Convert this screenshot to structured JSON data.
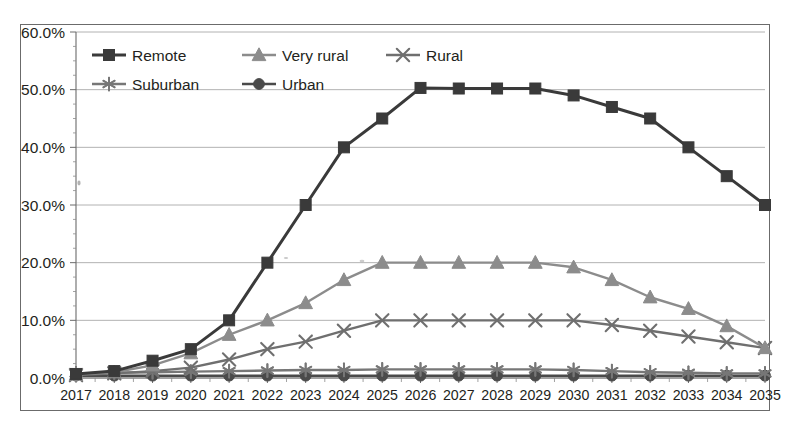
{
  "chart_data": {
    "type": "line",
    "title": "",
    "xlabel": "",
    "ylabel": "",
    "x": [
      2017,
      2018,
      2019,
      2020,
      2021,
      2022,
      2023,
      2024,
      2025,
      2026,
      2027,
      2028,
      2029,
      2030,
      2031,
      2032,
      2033,
      2034,
      2035
    ],
    "categories": [
      "2017",
      "2018",
      "2019",
      "2020",
      "2021",
      "2022",
      "2023",
      "2024",
      "2025",
      "2026",
      "2027",
      "2028",
      "2029",
      "2030",
      "2031",
      "2032",
      "2033",
      "2034",
      "2035"
    ],
    "ylim": [
      0,
      60
    ],
    "ytick_values": [
      0,
      10,
      20,
      30,
      40,
      50,
      60
    ],
    "ytick_labels": [
      "0.0%",
      "10.0%",
      "20.0%",
      "30.0%",
      "40.0%",
      "50.0%",
      "60.0%"
    ],
    "grid": true,
    "legend_position": "top-left-inside",
    "series": [
      {
        "name": "Remote",
        "marker": "square",
        "color": "#3a3a3a",
        "values": [
          0.7,
          1.2,
          3.0,
          5.0,
          10.0,
          20.0,
          30.0,
          40.0,
          45.0,
          50.3,
          50.2,
          50.2,
          50.2,
          49.0,
          47.0,
          45.0,
          40.0,
          35.0,
          30.0
        ]
      },
      {
        "name": "Very rural",
        "marker": "triangle",
        "color": "#8c8c8c",
        "values": [
          0.6,
          1.0,
          2.2,
          4.3,
          7.5,
          10.0,
          13.0,
          17.0,
          20.0,
          20.0,
          20.0,
          20.0,
          20.0,
          19.2,
          17.0,
          14.0,
          12.0,
          9.0,
          5.2
        ]
      },
      {
        "name": "Rural",
        "marker": "x",
        "color": "#6f6f6f",
        "values": [
          0.5,
          0.8,
          1.2,
          1.8,
          3.2,
          5.0,
          6.3,
          8.2,
          10.0,
          10.0,
          10.0,
          10.0,
          10.0,
          10.0,
          9.2,
          8.2,
          7.2,
          6.2,
          5.2
        ]
      },
      {
        "name": "Suburban",
        "marker": "star",
        "color": "#777777",
        "values": [
          0.8,
          0.9,
          1.0,
          1.1,
          1.2,
          1.3,
          1.4,
          1.4,
          1.5,
          1.5,
          1.5,
          1.5,
          1.5,
          1.4,
          1.2,
          1.0,
          0.9,
          0.8,
          0.8
        ]
      },
      {
        "name": "Urban",
        "marker": "circle",
        "color": "#4a4a4a",
        "values": [
          0.4,
          0.4,
          0.4,
          0.4,
          0.4,
          0.4,
          0.4,
          0.4,
          0.4,
          0.4,
          0.4,
          0.4,
          0.4,
          0.4,
          0.4,
          0.4,
          0.4,
          0.4,
          0.4
        ]
      }
    ]
  },
  "legend": {
    "items": [
      {
        "label": "Remote"
      },
      {
        "label": "Very rural"
      },
      {
        "label": "Rural"
      },
      {
        "label": "Suburban"
      },
      {
        "label": "Urban"
      }
    ]
  },
  "colors": {
    "remote": "#3a3a3a",
    "very_rural": "#8c8c8c",
    "rural": "#6f6f6f",
    "suburban": "#777777",
    "urban": "#4a4a4a",
    "gridline": "#a9a9a9",
    "frame": "#6b6b6b",
    "text": "#231f20",
    "background": "#ffffff"
  }
}
